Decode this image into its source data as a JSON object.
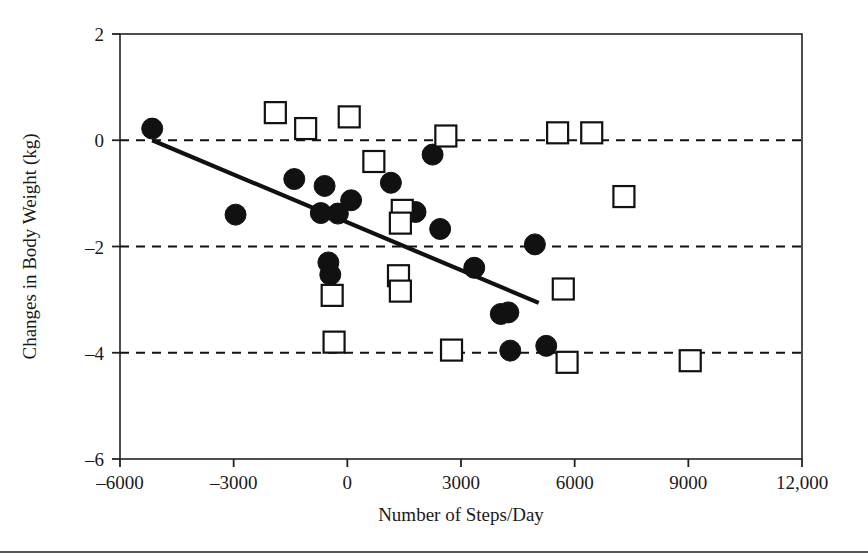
{
  "chart_data": {
    "type": "scatter",
    "title": "",
    "xlabel": "Number of Steps/Day",
    "ylabel": "Changes in Body Weight (kg)",
    "xlim": [
      -6000,
      12000
    ],
    "ylim": [
      -6,
      2
    ],
    "xticks": [
      -6000,
      -3000,
      0,
      3000,
      6000,
      9000,
      12000
    ],
    "xtick_labels": [
      "-6000",
      "-3000",
      "0",
      "3000",
      "6000",
      "9000",
      "12,000"
    ],
    "yticks": [
      2,
      0,
      -2,
      -4,
      -6
    ],
    "ytick_labels": [
      "2",
      "0",
      "-2",
      "-4",
      "-6"
    ],
    "grid": "horizontal dashed gridlines at y = 0, -2, -4",
    "gridlines": [
      0,
      -2,
      -4
    ],
    "legend": "none",
    "series": [
      {
        "name": "filled-circles",
        "marker": "filled circle",
        "color": "#111111",
        "points": [
          {
            "x": -5150,
            "y": 0.22
          },
          {
            "x": -2950,
            "y": -1.4
          },
          {
            "x": -1400,
            "y": -0.73
          },
          {
            "x": -600,
            "y": -0.86
          },
          {
            "x": -700,
            "y": -1.37
          },
          {
            "x": -250,
            "y": -1.38
          },
          {
            "x": 100,
            "y": -1.13
          },
          {
            "x": 1150,
            "y": -0.8
          },
          {
            "x": 2250,
            "y": -0.27
          },
          {
            "x": 1800,
            "y": -1.35
          },
          {
            "x": 2450,
            "y": -1.67
          },
          {
            "x": 3350,
            "y": -2.4
          },
          {
            "x": 4950,
            "y": -1.96
          },
          {
            "x": -500,
            "y": -2.3
          },
          {
            "x": -450,
            "y": -2.53
          },
          {
            "x": 4050,
            "y": -3.27
          },
          {
            "x": 4250,
            "y": -3.24
          },
          {
            "x": 5250,
            "y": -3.87
          },
          {
            "x": 4300,
            "y": -3.96
          }
        ]
      },
      {
        "name": "open-squares",
        "marker": "open square",
        "color": "#111111",
        "points": [
          {
            "x": -1900,
            "y": 0.52
          },
          {
            "x": -1100,
            "y": 0.22
          },
          {
            "x": 50,
            "y": 0.44
          },
          {
            "x": 5550,
            "y": 0.14
          },
          {
            "x": 6450,
            "y": 0.14
          },
          {
            "x": 2600,
            "y": 0.08
          },
          {
            "x": 700,
            "y": -0.4
          },
          {
            "x": 7300,
            "y": -1.06
          },
          {
            "x": 1450,
            "y": -1.32
          },
          {
            "x": 1400,
            "y": -1.56
          },
          {
            "x": 1350,
            "y": -2.55
          },
          {
            "x": 1400,
            "y": -2.84
          },
          {
            "x": 5700,
            "y": -2.8
          },
          {
            "x": -400,
            "y": -2.92
          },
          {
            "x": -350,
            "y": -3.8
          },
          {
            "x": 2750,
            "y": -3.95
          },
          {
            "x": 5800,
            "y": -4.18
          },
          {
            "x": 9050,
            "y": -4.15
          }
        ]
      }
    ],
    "trendline": {
      "name": "regression-line",
      "x0": -5150,
      "y0": 0.0,
      "x1": 5050,
      "y1": -3.06,
      "style": "solid black"
    }
  }
}
